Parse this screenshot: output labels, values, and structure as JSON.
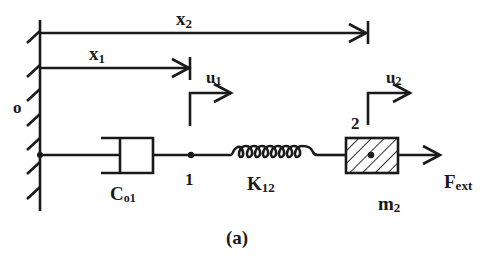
{
  "diagram": {
    "caption": "(a)",
    "origin_label": "o",
    "positions": {
      "x1": {
        "main": "x",
        "sub": "1"
      },
      "x2": {
        "main": "x",
        "sub": "2"
      }
    },
    "displacements": {
      "u1": {
        "main": "u",
        "sub": "1"
      },
      "u2": {
        "main": "u",
        "sub": "2"
      }
    },
    "nodes": {
      "node1": "1",
      "node2": "2"
    },
    "elements": {
      "damper": {
        "main": "C",
        "sub": "o1"
      },
      "spring": {
        "main": "K",
        "sub": "12"
      },
      "mass": {
        "main": "m",
        "sub": "2"
      },
      "force": {
        "main": "F",
        "sub": "ext"
      }
    },
    "colors": {
      "ink": "#1a1a1a",
      "background": "#ffffff"
    }
  }
}
